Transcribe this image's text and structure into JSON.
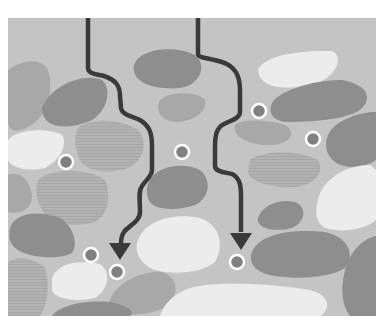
{
  "diagram": {
    "title": "",
    "frame": {
      "x": 8,
      "y": 18,
      "width": 368,
      "height": 298
    },
    "colors": {
      "background": "#ffffff",
      "matrix": "#c4c4c4",
      "grain_dark": "#8e8e8e",
      "grain_mid": "#a8a8a8",
      "grain_light": "#ececec",
      "grain_striped": "#b4b4b4",
      "path": "#3a3a3a",
      "particle_fill": "#808080",
      "particle_ring": "#ffffff"
    },
    "grains": [
      {
        "tone": "mid",
        "d": "M8,70 C30,55 50,60 50,80 C52,105 40,125 20,130 C12,132 8,128 8,120 Z"
      },
      {
        "tone": "dark",
        "d": "M42,108 C50,85 85,72 102,80 C112,88 108,110 92,120 C70,130 42,130 42,108 Z"
      },
      {
        "tone": "dark",
        "d": "M134,65 C140,48 175,45 195,55 C208,65 200,85 180,88 C160,90 130,85 134,65 Z"
      },
      {
        "tone": "mid",
        "d": "M160,100 C170,90 200,92 205,100 C208,110 195,122 175,122 C160,120 155,110 160,100 Z"
      },
      {
        "tone": "light",
        "d": "M258,70 C262,58 290,50 332,51 C342,55 340,72 320,82 C295,90 260,92 258,70 Z"
      },
      {
        "tone": "dark",
        "d": "M272,103 C278,92 310,80 342,80 C370,85 372,100 360,110 C345,120 310,122 285,122 C272,120 268,112 272,103 Z"
      },
      {
        "tone": "mid",
        "d": "M235,125 C242,118 270,120 285,125 C298,132 290,145 270,145 C245,145 232,135 235,125 Z"
      },
      {
        "tone": "dark",
        "d": "M328,135 C335,120 360,112 376,112 L376,160 C365,168 345,170 335,162 C326,155 324,145 328,135 Z"
      },
      {
        "tone": "light",
        "d": "M8,140 C18,128 50,128 62,135 C68,145 60,160 45,168 C30,172 10,168 8,160 Z"
      },
      {
        "tone": "striped",
        "d": "M78,128 C90,118 120,118 138,130 C148,142 145,160 128,168 C108,175 82,172 78,155 C75,145 74,135 78,128 Z"
      },
      {
        "tone": "mid",
        "d": "M8,175 C20,170 32,182 32,198 C30,210 20,215 8,212 Z"
      },
      {
        "tone": "striped",
        "d": "M38,180 C50,168 90,168 105,180 C112,195 108,215 95,222 C75,228 50,225 42,210 C36,200 35,190 38,180 Z"
      },
      {
        "tone": "dark",
        "d": "M10,228 C15,212 40,210 60,218 C75,228 78,245 72,253 C60,260 30,258 18,250 C10,245 8,238 10,228 Z"
      },
      {
        "tone": "dark",
        "d": "M150,180 C158,165 185,162 200,170 C212,180 210,198 195,205 C175,212 150,210 148,198 C146,190 147,185 150,180 Z"
      },
      {
        "tone": "light",
        "d": "M138,240 C145,222 170,212 200,218 C220,225 225,245 215,262 C200,275 165,275 150,268 C138,260 134,250 138,240 Z"
      },
      {
        "tone": "striped",
        "d": "M250,160 C262,150 300,150 318,160 C325,172 315,185 295,187 C270,188 250,182 248,172 Z"
      },
      {
        "tone": "light",
        "d": "M318,200 C322,180 345,165 370,165 L376,170 L376,220 C365,230 340,233 325,228 C315,222 315,210 318,200 Z"
      },
      {
        "tone": "dark",
        "d": "M258,218 C262,205 280,198 295,202 C308,208 305,222 292,228 C278,232 256,230 258,218 Z"
      },
      {
        "tone": "dark",
        "d": "M252,252 C258,235 290,228 325,232 C350,238 355,255 345,268 C330,278 295,280 270,275 C255,272 248,262 252,252 Z"
      },
      {
        "tone": "striped",
        "d": "M8,262 C18,255 35,258 45,268 C50,282 48,305 40,316 L8,316 Z"
      },
      {
        "tone": "light",
        "d": "M52,278 C58,262 80,260 100,264 C112,272 108,290 95,298 C78,302 55,300 52,290 Z"
      },
      {
        "tone": "mid",
        "d": "M110,300 C115,285 140,270 162,272 C180,278 178,295 168,305 C155,315 130,316 115,314 C108,310 108,305 110,300 Z"
      },
      {
        "tone": "dark",
        "d": "M52,316 C60,305 85,300 110,302 C130,306 135,312 130,316 Z"
      },
      {
        "tone": "light",
        "d": "M160,316 C165,300 180,288 205,285 C240,282 280,285 310,290 C332,296 330,310 320,316 Z"
      },
      {
        "tone": "light",
        "d": "M182,316 C192,308 205,305 220,310 L225,316 Z"
      },
      {
        "tone": "dark",
        "d": "M345,270 C350,250 365,238 376,236 L376,316 L350,316 C342,305 340,290 345,270 Z"
      }
    ],
    "paths": [
      {
        "name": "left-flow-path",
        "d": "M88,18 L88,68 C88,74 96,74 104,76 C116,80 120,86 120,96 L121,108 C122,115 132,116 140,120 C150,126 152,134 152,146 L152,170 C152,176 146,180 142,186 C138,192 140,200 140,212 C140,222 128,226 124,232 C121,236 121,240 121,244",
        "arrow": {
          "x": 120,
          "y": 258,
          "direction": "down"
        }
      },
      {
        "name": "right-flow-path",
        "d": "M198,18 L198,54 C198,58 210,58 222,62 C234,66 240,74 240,90 L240,112 C240,118 232,120 224,124 C216,128 215,136 215,148 L215,166 C215,172 224,172 232,174 C240,178 241,186 241,196 L241,232",
        "arrow": {
          "x": 241,
          "y": 248,
          "direction": "down"
        }
      }
    ],
    "particles": [
      {
        "cx": 66,
        "cy": 162
      },
      {
        "cx": 182,
        "cy": 152
      },
      {
        "cx": 259,
        "cy": 111
      },
      {
        "cx": 313,
        "cy": 139
      },
      {
        "cx": 91,
        "cy": 255
      },
      {
        "cx": 117,
        "cy": 272
      },
      {
        "cx": 237,
        "cy": 262
      }
    ]
  }
}
